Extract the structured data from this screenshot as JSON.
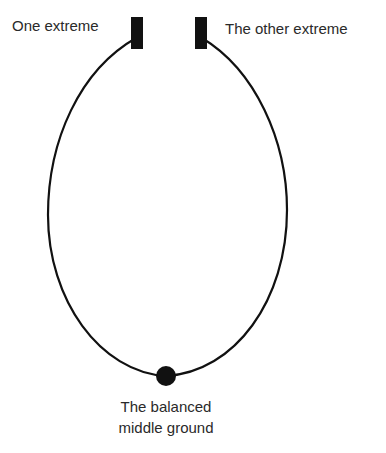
{
  "diagram": {
    "labels": {
      "left_extreme": "One extreme",
      "right_extreme": "The other extreme",
      "middle_line1": "The balanced",
      "middle_line2": "middle ground"
    },
    "colors": {
      "stroke": "#111111",
      "text": "#2a2a2a",
      "background": "#ffffff"
    }
  }
}
